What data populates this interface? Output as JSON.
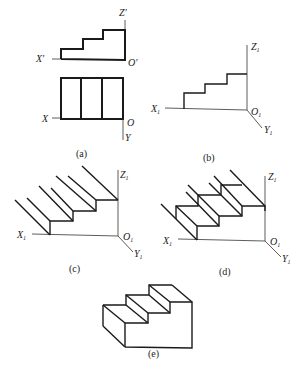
{
  "figure": {
    "panels": [
      {
        "id": "a",
        "caption": "(a)",
        "labels": {
          "z": "Z′",
          "x_front": "X′",
          "o_front": "O′",
          "x_top": "X",
          "o_top": "O",
          "y_top": "Y"
        }
      },
      {
        "id": "b",
        "caption": "(b)",
        "labels": {
          "z": "Z",
          "x": "X",
          "o": "O",
          "y": "Y",
          "sub": "1"
        }
      },
      {
        "id": "c",
        "caption": "(c)",
        "labels": {
          "z": "Z",
          "x": "X",
          "o": "O",
          "y": "Y",
          "sub": "1"
        }
      },
      {
        "id": "d",
        "caption": "(d)",
        "labels": {
          "z": "Z",
          "x": "X",
          "o": "O",
          "y": "Y",
          "sub": "1"
        }
      },
      {
        "id": "e",
        "caption": "(e)"
      }
    ]
  }
}
